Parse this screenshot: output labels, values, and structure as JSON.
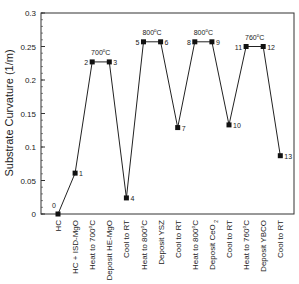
{
  "chart_data": {
    "type": "line",
    "title": "",
    "xlabel": "",
    "ylabel": "Substrate Curvature (1/m)",
    "ylim": [
      0,
      0.3
    ],
    "yticks": [
      0,
      0.05,
      0.1,
      0.15,
      0.2,
      0.25,
      0.3
    ],
    "ytick_labels": [
      "0",
      "0.05",
      "0.1",
      "0.15",
      "0.2",
      "0.25",
      "0.3"
    ],
    "grid": false,
    "legend": null,
    "categories": [
      "HC",
      "HC + ISD-MgO",
      "Heat to 700°C",
      "Deposit HE-MgO",
      "Cool to RT",
      "Heat to 800°C",
      "Deposit YSZ",
      "Cool to RT",
      "Heat to 800°C",
      "Deposit CeO2",
      "Cool to RT",
      "Heat to 760°C",
      "Deposit YBCO",
      "Cool to RT"
    ],
    "point_labels": [
      "0",
      "1",
      "2",
      "3",
      "4",
      "5",
      "6",
      "7",
      "8",
      "9",
      "10",
      "11",
      "12",
      "13"
    ],
    "values": [
      0,
      0.061,
      0.227,
      0.227,
      0.024,
      0.257,
      0.257,
      0.129,
      0.257,
      0.257,
      0.133,
      0.25,
      0.25,
      0.087
    ],
    "annotations": [
      {
        "text": "700°C",
        "between": [
          2,
          3
        ]
      },
      {
        "text": "800°C",
        "between": [
          5,
          6
        ]
      },
      {
        "text": "800°C",
        "between": [
          8,
          9
        ]
      },
      {
        "text": "760°C",
        "between": [
          11,
          12
        ]
      }
    ]
  }
}
